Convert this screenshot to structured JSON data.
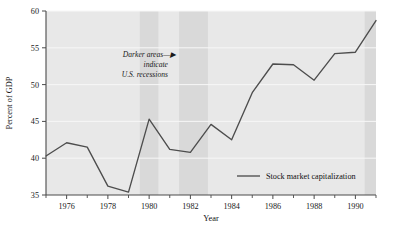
{
  "chart_data": {
    "type": "line",
    "title": "",
    "subtitle": "",
    "xlabel": "Year",
    "ylabel": "Percent of GDP",
    "xlim": [
      1975,
      1991
    ],
    "ylim": [
      35,
      60
    ],
    "grid": true,
    "grid_axis": "y",
    "legend_position": "inside-bottom-right",
    "x": [
      1975,
      1976,
      1977,
      1978,
      1979,
      1980,
      1981,
      1982,
      1983,
      1984,
      1985,
      1986,
      1987,
      1988,
      1989,
      1990,
      1991
    ],
    "series": [
      {
        "name": "Stock market capitalization",
        "values": [
          40.3,
          42.1,
          41.5,
          36.2,
          35.4,
          45.3,
          41.2,
          40.8,
          44.6,
          42.5,
          48.9,
          52.8,
          52.7,
          50.6,
          54.2,
          54.4,
          58.7
        ]
      }
    ],
    "x_tick_labels": [
      "1976",
      "1978",
      "1980",
      "1982",
      "1984",
      "1986",
      "1988",
      "1990"
    ],
    "x_tick_values": [
      1976,
      1978,
      1980,
      1982,
      1984,
      1986,
      1988,
      1990
    ],
    "x_minor_tick_values": [
      1975,
      1977,
      1979,
      1981,
      1983,
      1985,
      1987,
      1989,
      1991
    ],
    "y_tick_labels": [
      "35",
      "40",
      "45",
      "50",
      "55",
      "60"
    ],
    "y_tick_values": [
      35,
      40,
      45,
      50,
      55,
      60
    ],
    "annotations": [
      {
        "name": "recession-note",
        "lines": [
          "Darker areas—▶",
          "indicate",
          "U.S. recessions"
        ],
        "x": 1978.0,
        "y": 53.5
      }
    ],
    "shaded_bands": [
      {
        "name": "recession-band-1",
        "x0": 1979.55,
        "x1": 1980.45,
        "label": "U.S. recession"
      },
      {
        "name": "recession-band-2",
        "x0": 1981.45,
        "x1": 1982.85,
        "label": "U.S. recession"
      },
      {
        "name": "recession-band-3",
        "x0": 1990.45,
        "x1": 1991.2,
        "label": "U.S. recession"
      }
    ],
    "colors": {
      "plot_background": "#e8e8e8",
      "recession_band": "#d9d9d9",
      "gridline": "#f7f7f7",
      "series_line": "#4d4d4d",
      "axis": "#4a4a4a",
      "text": "#111111",
      "page_background": "#ffffff"
    }
  },
  "axes": {
    "y_title": "Percent of GDP",
    "x_title": "Year"
  },
  "legend": {
    "entries": [
      {
        "label": "Stock market capitalization",
        "marker": "line",
        "color": "#4d4d4d"
      }
    ]
  },
  "annotation": {
    "line1": "Darker areas—▶",
    "line2": "indicate",
    "line3": "U.S. recessions"
  },
  "y_ticks": {
    "t0": "60",
    "t1": "55",
    "t2": "50",
    "t3": "45",
    "t4": "40",
    "t5": "35"
  },
  "x_ticks": {
    "t0": "1976",
    "t1": "1978",
    "t2": "1980",
    "t3": "1982",
    "t4": "1984",
    "t5": "1986",
    "t6": "1988",
    "t7": "1990"
  }
}
